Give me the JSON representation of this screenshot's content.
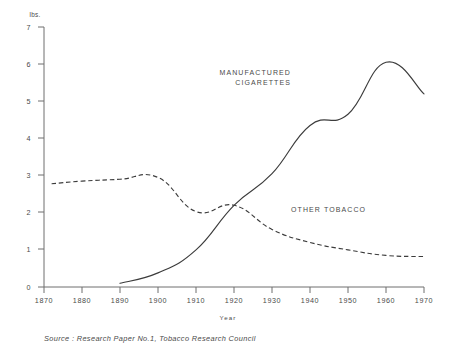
{
  "chart_data": {
    "type": "line",
    "title": "",
    "subtitle": "",
    "xlabel": "Year",
    "ylabel": "lbs.",
    "y_unit_label": "lbs.",
    "xlim": [
      1870,
      1970
    ],
    "ylim": [
      0,
      7
    ],
    "grid": false,
    "legend_position": "inline-annotation",
    "x_ticks": [
      "1870",
      "1880",
      "1890",
      "1900",
      "1910",
      "1920",
      "1930",
      "1940",
      "1950",
      "1960",
      "1970"
    ],
    "y_ticks": [
      "0",
      "1",
      "2",
      "3",
      "4",
      "5",
      "6",
      "7"
    ],
    "series": [
      {
        "name": "MANUFACTURED CIGARETTES",
        "style": "solid",
        "label_line1": "MANUFACTURED",
        "label_line2": "CIGARETTES",
        "x": [
          1890,
          1900,
          1910,
          1920,
          1930,
          1940,
          1950,
          1960,
          1970
        ],
        "values": [
          0.1,
          0.38,
          1.0,
          2.2,
          3.05,
          4.35,
          4.65,
          6.05,
          5.2
        ]
      },
      {
        "name": "OTHER TOBACCO",
        "style": "dashed",
        "label_line1": "OTHER  TOBACCO",
        "label_line2": "",
        "x": [
          1872,
          1880,
          1890,
          1900,
          1910,
          1920,
          1930,
          1940,
          1950,
          1960,
          1970
        ],
        "values": [
          2.78,
          2.85,
          2.9,
          2.95,
          2.03,
          2.2,
          1.55,
          1.2,
          1.0,
          0.85,
          0.82
        ]
      }
    ],
    "annotations": [
      {
        "text": "MANUFACTURED",
        "x": 1935,
        "y": 5.72
      },
      {
        "text": "CIGARETTES",
        "x": 1935,
        "y": 5.45
      },
      {
        "text": "OTHER  TOBACCO",
        "x": 1935,
        "y": 2.02
      }
    ],
    "source": "Source :  Research Paper No.1, Tobacco Research Council"
  }
}
